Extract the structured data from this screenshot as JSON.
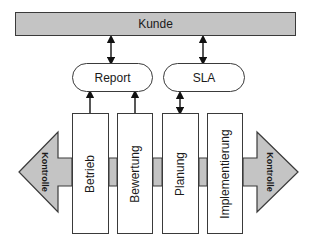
{
  "diagram": {
    "top_bar": {
      "label": "Kunde"
    },
    "interfaces": [
      {
        "label": "Report"
      },
      {
        "label": "SLA"
      }
    ],
    "processes": [
      {
        "label": "Betrieb"
      },
      {
        "label": "Bewertung"
      },
      {
        "label": "Planung"
      },
      {
        "label": "Implementierung"
      }
    ],
    "control_arrows": {
      "left": {
        "label": "Kontrolle"
      },
      "right": {
        "label": "Kontrolle"
      }
    },
    "colors": {
      "gray_fill": "#c4c4c4",
      "stroke": "#3a3a3a",
      "box_fill": "#ffffff"
    },
    "connections": [
      {
        "from": "Kunde",
        "to": "Report",
        "type": "bidirectional"
      },
      {
        "from": "Kunde",
        "to": "SLA",
        "type": "bidirectional"
      },
      {
        "from": "Betrieb",
        "to": "Report",
        "type": "directed"
      },
      {
        "from": "Bewertung",
        "to": "Report",
        "type": "directed"
      },
      {
        "from": "Planung",
        "to": "SLA",
        "type": "bidirectional"
      }
    ]
  }
}
